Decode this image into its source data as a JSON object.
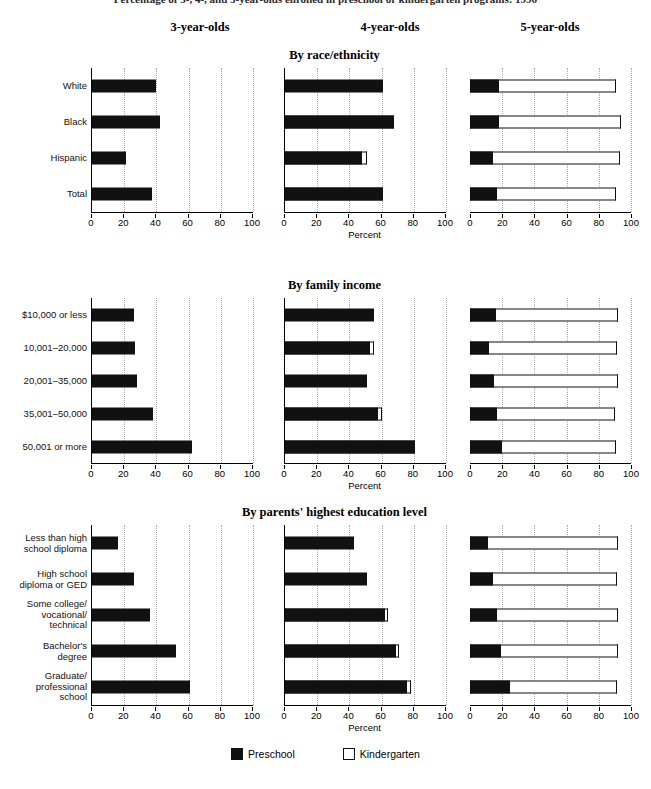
{
  "figure": {
    "title_truncated": "Percentage of 3-, 4-, and 5-year-olds enrolled in preschool or kindergarten programs: 1996"
  },
  "column_headers": [
    "3-year-olds",
    "4-year-olds",
    "5-year-olds"
  ],
  "axis": {
    "xlabel": "Percent",
    "ticks": [
      0,
      20,
      40,
      60,
      80,
      100
    ],
    "xlim": [
      0,
      100
    ]
  },
  "legend": {
    "position": "bottom-center",
    "entries": [
      {
        "label": "Preschool",
        "swatch": "filled",
        "color": "#111111"
      },
      {
        "label": "Kindergarten",
        "swatch": "hollow",
        "color": "#ffffff"
      }
    ]
  },
  "chart_data": {
    "type": "bar",
    "orientation": "horizontal",
    "stacked": true,
    "title": "Percentage of 3-, 4-, and 5-year-olds enrolled in preschool or kindergarten programs: 1996",
    "xlabel": "Percent",
    "ylabel": "",
    "xlim": [
      0,
      100
    ],
    "grid": "vertical-dotted",
    "series_names": [
      "Preschool",
      "Kindergarten"
    ],
    "panel_columns": [
      "3-year-olds",
      "4-year-olds",
      "5-year-olds"
    ],
    "panels": [
      {
        "title": "By race/ethnicity",
        "categories": [
          "White",
          "Black",
          "Hispanic",
          "Total"
        ],
        "columns": [
          {
            "name": "3-year-olds",
            "preschool": [
              40,
              42,
              21,
              37
            ],
            "kindergarten": [
              0,
              0,
              0,
              0
            ]
          },
          {
            "name": "4-year-olds",
            "preschool": [
              61,
              67,
              48,
              60
            ],
            "kindergarten": [
              0,
              1,
              3,
              1
            ]
          },
          {
            "name": "5-year-olds",
            "preschool": [
              18,
              18,
              14,
              17
            ],
            "kindergarten": [
              73,
              76,
              79,
              74
            ]
          }
        ]
      },
      {
        "title": "By family income",
        "categories": [
          "$10,000 or less",
          "10,001–20,000",
          "20,001–35,000",
          "35,001–50,000",
          "50,001 or more"
        ],
        "columns": [
          {
            "name": "3-year-olds",
            "preschool": [
              26,
              27,
              28,
              38,
              62
            ],
            "kindergarten": [
              0,
              0,
              0,
              0,
              0
            ]
          },
          {
            "name": "4-year-olds",
            "preschool": [
              55,
              53,
              51,
              58,
              80
            ],
            "kindergarten": [
              0,
              2,
              0,
              2,
              1
            ]
          },
          {
            "name": "5-year-olds",
            "preschool": [
              16,
              12,
              15,
              17,
              20
            ],
            "kindergarten": [
              76,
              79,
              77,
              73,
              71
            ]
          }
        ]
      },
      {
        "title": "By parents' highest education level",
        "categories": [
          "Less than high\nschool diploma",
          "High school\ndiploma or GED",
          "Some college/\nvocational/\ntechnical",
          "Bachelor's\ndegree",
          "Graduate/\nprofessional\nschool"
        ],
        "columns": [
          {
            "name": "3-year-olds",
            "preschool": [
              16,
              26,
              36,
              52,
              61
            ],
            "kindergarten": [
              0,
              0,
              0,
              0,
              0
            ]
          },
          {
            "name": "4-year-olds",
            "preschool": [
              43,
              51,
              62,
              69,
              76
            ],
            "kindergarten": [
              0,
              0,
              2,
              2,
              2
            ]
          },
          {
            "name": "5-year-olds",
            "preschool": [
              11,
              14,
              17,
              19,
              25
            ],
            "kindergarten": [
              81,
              77,
              75,
              73,
              66
            ]
          }
        ]
      }
    ]
  }
}
